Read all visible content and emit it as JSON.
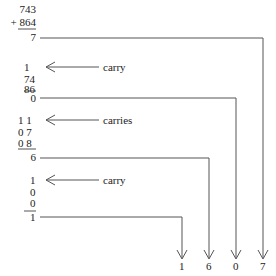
{
  "problem": {
    "addend1": "743",
    "addend2": "+ 864",
    "result_digit": "7"
  },
  "step2": {
    "carry": "1",
    "row1": "74",
    "row2": "86",
    "result_digit": "0",
    "label": "carry"
  },
  "step3": {
    "carry": "1 1",
    "row1": "0 7",
    "row2": "0 8",
    "result_digit": "6",
    "label": "carries"
  },
  "step4": {
    "carry": "1",
    "row1": "0",
    "row2": "0",
    "result_digit": "1",
    "label": "carry"
  },
  "answer": {
    "digits": [
      "1",
      "6",
      "0",
      "7"
    ]
  },
  "colors": {
    "line": "#555555",
    "text": "#222222"
  }
}
